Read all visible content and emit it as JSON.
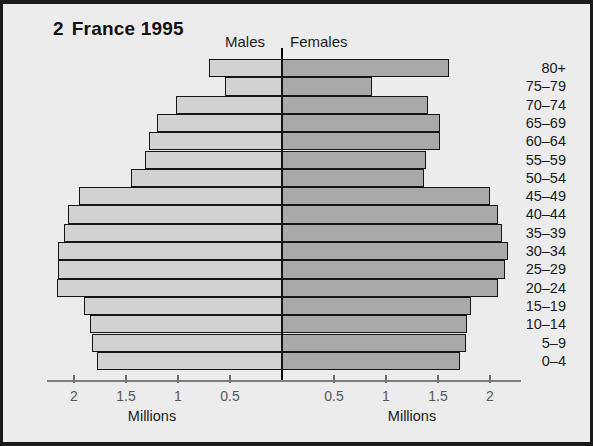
{
  "figure": {
    "number": "2",
    "title": "France 1995"
  },
  "headers": {
    "males": "Males",
    "females": "Females"
  },
  "axis": {
    "left_title": "Millions",
    "right_title": "Millions",
    "left_ticks": [
      "2",
      "1.5",
      "1",
      "0.5"
    ],
    "right_ticks": [
      "0.5",
      "1",
      "1.5",
      "2"
    ]
  },
  "colors": {
    "male_bar": "#d2d2d2",
    "female_bar": "#a9a9a9",
    "bar_outline": "#151515",
    "background": "#ececec",
    "frame": "#1a1a1a"
  },
  "chart_data": {
    "type": "bar",
    "xlabel": "Millions",
    "ylabel": "Age group",
    "xlim": [
      0,
      2.25
    ],
    "grid": false,
    "legend_position": "top-center",
    "orientation": "population-pyramid",
    "units": "millions",
    "categories": [
      "80+",
      "75–79",
      "70–74",
      "65–69",
      "60–64",
      "55–59",
      "50–54",
      "45–49",
      "40–44",
      "35–39",
      "30–34",
      "25–29",
      "20–24",
      "15–19",
      "10–14",
      "5–9",
      "0–4"
    ],
    "series": [
      {
        "name": "Males",
        "side": "left",
        "values": [
          0.7,
          0.55,
          1.02,
          1.2,
          1.28,
          1.32,
          1.45,
          1.95,
          2.06,
          2.1,
          2.15,
          2.15,
          2.16,
          1.9,
          1.85,
          1.83,
          1.78
        ]
      },
      {
        "name": "Females",
        "side": "right",
        "values": [
          1.61,
          0.87,
          1.4,
          1.52,
          1.52,
          1.38,
          1.37,
          2.0,
          2.08,
          2.12,
          2.17,
          2.14,
          2.08,
          1.82,
          1.78,
          1.77,
          1.71
        ]
      }
    ]
  }
}
